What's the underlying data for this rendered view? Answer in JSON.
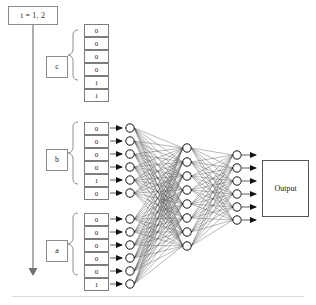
{
  "diagram": {
    "title_annotation": "t = 1, 2",
    "output_label": "Output",
    "colors": {
      "node_fill": "#ffffff",
      "node_stroke": "#111111",
      "connection": "#1a1a1a",
      "box_stroke": "#7d7d7d",
      "arrow": "#6e6e6e",
      "background": "#ffffff"
    },
    "timeline": {
      "label": "t = 1, 2",
      "arrow_direction": "down"
    },
    "input_blocks": [
      {
        "name": "c",
        "label": "c",
        "values": [
          "0",
          "0",
          "0",
          "0",
          "1",
          "1"
        ],
        "connected_to_hidden": false
      },
      {
        "name": "b",
        "label": "b",
        "values": [
          "0",
          "0",
          "0",
          "0",
          "1",
          "0"
        ],
        "connected_to_hidden": true
      },
      {
        "name": "a",
        "label": "a",
        "values": [
          "0",
          "0",
          "0",
          "0",
          "0",
          "1"
        ],
        "connected_to_hidden": true
      }
    ],
    "layers": [
      {
        "name": "hidden-1",
        "node_count": 12
      },
      {
        "name": "hidden-2",
        "node_count": 8
      },
      {
        "name": "hidden-3",
        "node_count": 6
      }
    ],
    "output": {
      "label": "Output"
    }
  }
}
